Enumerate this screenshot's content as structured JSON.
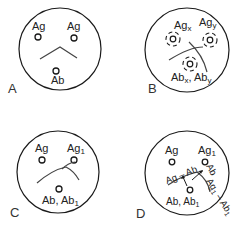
{
  "panels": [
    {
      "id": "A",
      "label": "A",
      "wells": {
        "ag_left": "Ag",
        "ag_right": "Ag",
        "ab": "Ab"
      },
      "pattern": "identity"
    },
    {
      "id": "B",
      "label": "B",
      "wells": {
        "ag_left_base": "Ag",
        "ag_left_sub": "x",
        "ag_right_base": "Ag",
        "ag_right_sub": "y",
        "ab_1_base": "Ab",
        "ab_1_sub": "x",
        "ab_sep": ", ",
        "ab_2_base": "Ab",
        "ab_2_sub": "y"
      },
      "pattern": "non-identity"
    },
    {
      "id": "C",
      "label": "C",
      "wells": {
        "ag_left": "Ag",
        "ag_right_base": "Ag",
        "ag_right_sub": "1",
        "ab_base": "Ab, Ab",
        "ab_sub": "1"
      },
      "pattern": "partial identity"
    },
    {
      "id": "D",
      "label": "D",
      "wells": {
        "ag_left": "Ag",
        "ag_right_base": "Ag",
        "ag_right_sub": "1",
        "ab_base": "Ab, Ab",
        "ab_sub": "1"
      },
      "annotations": {
        "complex_1": "Ag – Ab",
        "ab_arrow": "Ab",
        "complex_2_base": "Ag",
        "complex_2_sub": "1",
        "complex_2_mid": " – Ab",
        "complex_2_sub2": "1"
      },
      "pattern": "partial identity (spur)"
    }
  ],
  "colors": {
    "line": "#1a1a1a",
    "background": "#ffffff"
  }
}
